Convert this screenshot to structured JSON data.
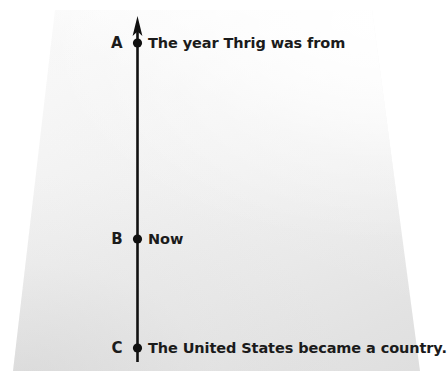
{
  "worksheet": {
    "type": "timeline-diagram",
    "medium": "photographed-paper",
    "background_color": "#ffffff",
    "paper_color": "#f0f0f0",
    "ink_color": "#1b1b1b"
  },
  "timeline": {
    "orientation": "vertical",
    "arrow_direction": "up",
    "axis_color": "#111111",
    "points": [
      {
        "letter": "A",
        "label": "The year Thrig was from",
        "y": 43
      },
      {
        "letter": "B",
        "label": "Now",
        "y": 239
      },
      {
        "letter": "C",
        "label": "The United States became a country.",
        "y": 348
      }
    ]
  },
  "icons": {
    "arrow_up": "arrow-up-icon",
    "point_marker": "filled-dot-icon"
  }
}
